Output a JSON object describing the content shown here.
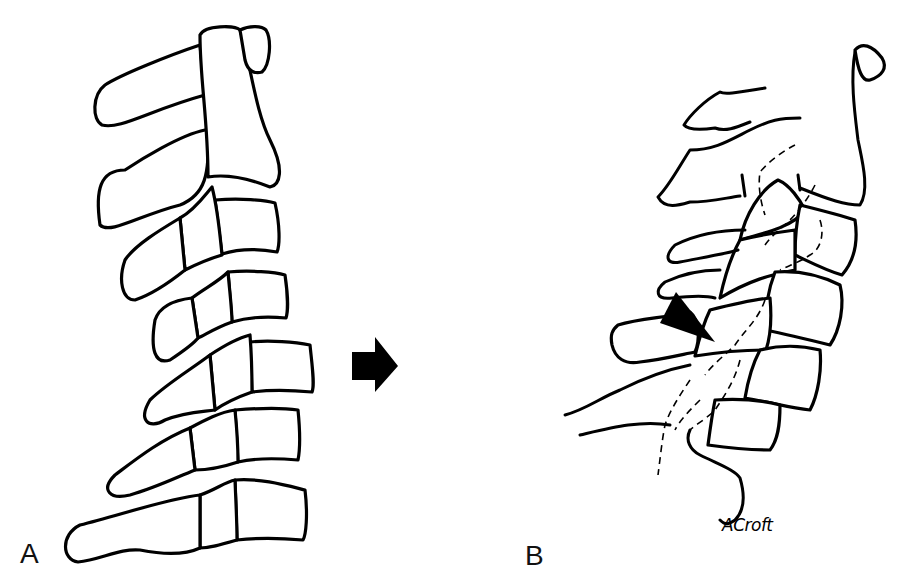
{
  "figure": {
    "type": "medical-illustration",
    "panels": [
      {
        "label": "A",
        "description": "Normal cervical spine, lateral view (C1–C7)"
      },
      {
        "label": "B",
        "description": "Injured cervical spine with vertebral displacement; arrowhead indicates the injury site"
      }
    ],
    "transition_arrow": "right-arrow",
    "signature": "ACroft",
    "colors": {
      "ink": "#000000",
      "background": "#ffffff"
    }
  }
}
